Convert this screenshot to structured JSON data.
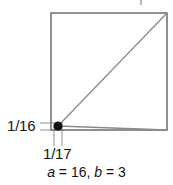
{
  "figure": {
    "title_clipped_mark": "",
    "square": {
      "x": 51,
      "y": 13,
      "width": 116,
      "height": 117,
      "stroke": "#6b6b6b"
    },
    "point": {
      "name": "intersection-dot",
      "x": 58,
      "y": 126,
      "radius": 4.6,
      "color": "#111111"
    },
    "lines": [
      {
        "name": "diagonal-to-top-right",
        "x1": 58,
        "y1": 126,
        "x2": 167,
        "y2": 13,
        "stroke": "#8a8a8a"
      },
      {
        "name": "shallow-line-to-bottom-right",
        "x1": 58,
        "y1": 126,
        "x2": 167,
        "y2": 130,
        "stroke": "#8a8a8a"
      }
    ],
    "leaders": [
      {
        "name": "y-leader-upper",
        "x1": 40,
        "y1": 123,
        "x2": 62,
        "y2": 123
      },
      {
        "name": "y-leader-lower",
        "x1": 40,
        "y1": 130,
        "x2": 62,
        "y2": 130
      },
      {
        "name": "x-tick-left",
        "x1": 54,
        "y1": 127,
        "x2": 54,
        "y2": 146
      },
      {
        "name": "x-tick-right",
        "x1": 62,
        "y1": 127,
        "x2": 62,
        "y2": 146
      }
    ]
  },
  "labels": {
    "y_value": "1/16",
    "x_value": "1/17"
  },
  "caption": {
    "var_a": "a",
    "eq1": " = ",
    "val_a": "16",
    "sep": ", ",
    "var_b": "b",
    "eq2": " = ",
    "val_b": "3"
  },
  "colors": {
    "square_stroke": "#6b6b6b",
    "line_stroke": "#8a8a8a",
    "leader_stroke": "#9a9a9a",
    "dot": "#111111",
    "text": "#141414",
    "background": "#ffffff"
  }
}
